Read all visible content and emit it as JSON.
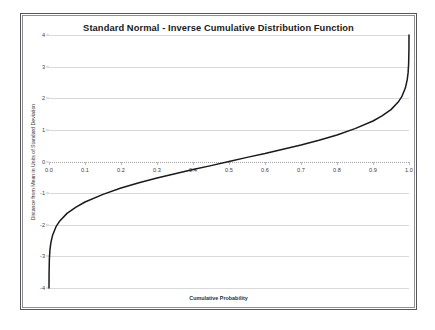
{
  "chart_data": {
    "type": "line",
    "title": "Standard Normal - Inverse Cumulative Distribution Function",
    "xlabel": "Cumulative Probability",
    "ylabel": "Distance from Mean in Units of Standard Deviation",
    "xlim": [
      0.0,
      1.0
    ],
    "ylim": [
      -4,
      4
    ],
    "grid": true,
    "legend": null,
    "xticks": [
      "0.0",
      "0.1",
      "0.2",
      "0.3",
      "0.4",
      "0.5",
      "0.6",
      "0.7",
      "0.8",
      "0.9",
      "1.0"
    ],
    "xtick_values": [
      0.0,
      0.1,
      0.2,
      0.3,
      0.4,
      0.5,
      0.6,
      0.7,
      0.8,
      0.9,
      1.0
    ],
    "yticks": [
      "4",
      "3",
      "2",
      "1",
      "0",
      "-1",
      "-2",
      "-3",
      "-4"
    ],
    "ytick_values": [
      4,
      3,
      2,
      1,
      0,
      -1,
      -2,
      -3,
      -4
    ],
    "series": [
      {
        "name": "Inverse Normal CDF",
        "color": "#1a1a1a",
        "x": [
          3e-05,
          0.0002,
          0.001,
          0.0025,
          0.005,
          0.01,
          0.02,
          0.03,
          0.05,
          0.075,
          0.1,
          0.15,
          0.2,
          0.25,
          0.3,
          0.35,
          0.4,
          0.45,
          0.5,
          0.55,
          0.6,
          0.65,
          0.7,
          0.75,
          0.8,
          0.85,
          0.9,
          0.925,
          0.95,
          0.97,
          0.98,
          0.99,
          0.995,
          0.9975,
          0.999,
          0.9998,
          0.99997
        ],
        "y": [
          -4.0,
          -3.54,
          -3.09,
          -2.81,
          -2.58,
          -2.33,
          -2.05,
          -1.88,
          -1.64,
          -1.44,
          -1.28,
          -1.04,
          -0.84,
          -0.67,
          -0.52,
          -0.39,
          -0.25,
          -0.13,
          0.0,
          0.13,
          0.25,
          0.39,
          0.52,
          0.67,
          0.84,
          1.04,
          1.28,
          1.44,
          1.64,
          1.88,
          2.05,
          2.33,
          2.58,
          2.81,
          3.09,
          3.54,
          4.0
        ]
      }
    ]
  }
}
